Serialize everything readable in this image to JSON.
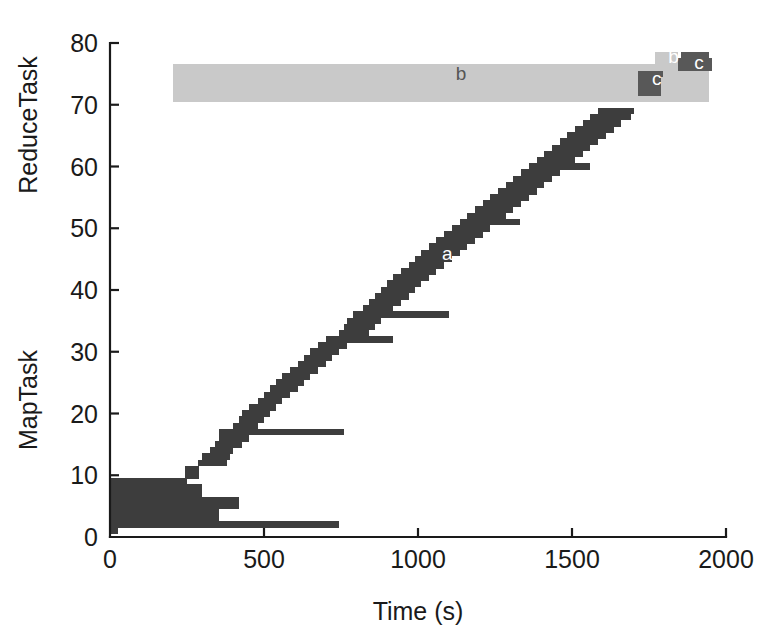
{
  "chart_data": {
    "type": "bar",
    "title": "",
    "xlabel": "Time (s)",
    "ylabel_lower": "MapTask",
    "ylabel_upper": "ReduceTask",
    "xlim": [
      0,
      2000
    ],
    "ylim": [
      0,
      80
    ],
    "xticks": [
      0,
      500,
      1000,
      1500,
      2000
    ],
    "xtick_labels": [
      "0",
      "500",
      "1000",
      "1500",
      "2000"
    ],
    "yticks": [
      0,
      10,
      20,
      30,
      40,
      50,
      60,
      70,
      80
    ],
    "ytick_labels": [
      "0",
      "10",
      "20",
      "30",
      "40",
      "50",
      "60",
      "70",
      "80"
    ],
    "grid": false,
    "legend_position": "none",
    "orientation": "horizontal",
    "bar_height_units": 1,
    "annotations": [
      {
        "text": "a",
        "x": 1095,
        "y": 45.6,
        "color": "#ffffff",
        "series": "map-phase"
      },
      {
        "text": "b",
        "x": 1140,
        "y": 74.9,
        "color": "#555555",
        "series": "shuffle-phase"
      },
      {
        "text": "b",
        "x": 1830,
        "y": 77.5,
        "color": "#ffffff",
        "series": "shuffle-phase"
      },
      {
        "text": "c",
        "x": 1775,
        "y": 74.0,
        "color": "#ffffff",
        "series": "reduce-phase"
      },
      {
        "text": "c",
        "x": 1912,
        "y": 76.6,
        "color": "#ffffff",
        "series": "reduce-phase"
      }
    ],
    "colors": {
      "map_phase": "#3d3d3d",
      "shuffle_phase": "#c9c9c9",
      "reduce_phase": "#585858",
      "axis": "#1a1a1a",
      "background": "#ffffff"
    },
    "series": [
      {
        "name": "map-phase",
        "label": "a",
        "color": "#3d3d3d",
        "bars": [
          {
            "task": 1,
            "start": 0,
            "end": 26
          },
          {
            "task": 2,
            "start": 0,
            "end": 745
          },
          {
            "task": 3,
            "start": 0,
            "end": 355
          },
          {
            "task": 4,
            "start": 0,
            "end": 355
          },
          {
            "task": 5,
            "start": 0,
            "end": 420
          },
          {
            "task": 6,
            "start": 0,
            "end": 420
          },
          {
            "task": 7,
            "start": 0,
            "end": 300
          },
          {
            "task": 8,
            "start": 0,
            "end": 300
          },
          {
            "task": 9,
            "start": 0,
            "end": 250
          },
          {
            "task": 10,
            "start": 245,
            "end": 290
          },
          {
            "task": 11,
            "start": 245,
            "end": 290
          },
          {
            "task": 12,
            "start": 285,
            "end": 380
          },
          {
            "task": 13,
            "start": 300,
            "end": 390
          },
          {
            "task": 14,
            "start": 325,
            "end": 400
          },
          {
            "task": 15,
            "start": 340,
            "end": 430
          },
          {
            "task": 16,
            "start": 355,
            "end": 450
          },
          {
            "task": 17,
            "start": 355,
            "end": 760
          },
          {
            "task": 18,
            "start": 400,
            "end": 480
          },
          {
            "task": 19,
            "start": 420,
            "end": 500
          },
          {
            "task": 20,
            "start": 430,
            "end": 520
          },
          {
            "task": 21,
            "start": 450,
            "end": 540
          },
          {
            "task": 22,
            "start": 480,
            "end": 560
          },
          {
            "task": 23,
            "start": 500,
            "end": 585
          },
          {
            "task": 24,
            "start": 520,
            "end": 610
          },
          {
            "task": 25,
            "start": 540,
            "end": 630
          },
          {
            "task": 26,
            "start": 560,
            "end": 650
          },
          {
            "task": 27,
            "start": 585,
            "end": 675
          },
          {
            "task": 28,
            "start": 610,
            "end": 700
          },
          {
            "task": 29,
            "start": 630,
            "end": 720
          },
          {
            "task": 30,
            "start": 650,
            "end": 745
          },
          {
            "task": 31,
            "start": 675,
            "end": 770
          },
          {
            "task": 32,
            "start": 700,
            "end": 920
          },
          {
            "task": 33,
            "start": 745,
            "end": 840
          },
          {
            "task": 34,
            "start": 760,
            "end": 860
          },
          {
            "task": 35,
            "start": 770,
            "end": 880
          },
          {
            "task": 36,
            "start": 790,
            "end": 1100
          },
          {
            "task": 37,
            "start": 820,
            "end": 920
          },
          {
            "task": 38,
            "start": 840,
            "end": 945
          },
          {
            "task": 39,
            "start": 860,
            "end": 970
          },
          {
            "task": 40,
            "start": 880,
            "end": 990
          },
          {
            "task": 41,
            "start": 900,
            "end": 1010
          },
          {
            "task": 42,
            "start": 920,
            "end": 1035
          },
          {
            "task": 43,
            "start": 945,
            "end": 1060
          },
          {
            "task": 44,
            "start": 970,
            "end": 1085
          },
          {
            "task": 45,
            "start": 990,
            "end": 1110
          },
          {
            "task": 46,
            "start": 1010,
            "end": 1135
          },
          {
            "task": 47,
            "start": 1035,
            "end": 1160
          },
          {
            "task": 48,
            "start": 1060,
            "end": 1185
          },
          {
            "task": 49,
            "start": 1085,
            "end": 1210
          },
          {
            "task": 50,
            "start": 1110,
            "end": 1235
          },
          {
            "task": 51,
            "start": 1135,
            "end": 1330
          },
          {
            "task": 52,
            "start": 1160,
            "end": 1285
          },
          {
            "task": 53,
            "start": 1185,
            "end": 1310
          },
          {
            "task": 54,
            "start": 1210,
            "end": 1335
          },
          {
            "task": 55,
            "start": 1235,
            "end": 1360
          },
          {
            "task": 56,
            "start": 1260,
            "end": 1385
          },
          {
            "task": 57,
            "start": 1285,
            "end": 1410
          },
          {
            "task": 58,
            "start": 1310,
            "end": 1435
          },
          {
            "task": 59,
            "start": 1335,
            "end": 1460
          },
          {
            "task": 60,
            "start": 1360,
            "end": 1560
          },
          {
            "task": 61,
            "start": 1385,
            "end": 1510
          },
          {
            "task": 62,
            "start": 1410,
            "end": 1535
          },
          {
            "task": 63,
            "start": 1435,
            "end": 1560
          },
          {
            "task": 64,
            "start": 1460,
            "end": 1585
          },
          {
            "task": 65,
            "start": 1485,
            "end": 1610
          },
          {
            "task": 66,
            "start": 1510,
            "end": 1635
          },
          {
            "task": 67,
            "start": 1535,
            "end": 1660
          },
          {
            "task": 68,
            "start": 1560,
            "end": 1690
          },
          {
            "task": 69,
            "start": 1585,
            "end": 1700
          }
        ]
      },
      {
        "name": "shuffle-phase",
        "label": "b",
        "color": "#c9c9c9",
        "bars": [
          {
            "task": 71,
            "start": 205,
            "end": 1945
          },
          {
            "task": 72,
            "start": 205,
            "end": 1945
          },
          {
            "task": 73,
            "start": 205,
            "end": 1945
          },
          {
            "task": 74,
            "start": 205,
            "end": 1945
          },
          {
            "task": 75,
            "start": 205,
            "end": 1945
          },
          {
            "task": 76,
            "start": 205,
            "end": 1945
          },
          {
            "task": 77,
            "start": 1770,
            "end": 1845
          },
          {
            "task": 78,
            "start": 1770,
            "end": 1845
          }
        ]
      },
      {
        "name": "reduce-phase",
        "label": "c",
        "color": "#585858",
        "bars": [
          {
            "task": 72,
            "start": 1715,
            "end": 1790
          },
          {
            "task": 73,
            "start": 1715,
            "end": 1790
          },
          {
            "task": 74,
            "start": 1715,
            "end": 1790
          },
          {
            "task": 75,
            "start": 1715,
            "end": 1795
          },
          {
            "task": 76,
            "start": 1845,
            "end": 1955
          },
          {
            "task": 77,
            "start": 1845,
            "end": 1955
          },
          {
            "task": 78,
            "start": 1855,
            "end": 1945
          }
        ]
      }
    ]
  },
  "axes": {
    "plot_left_px": 110,
    "plot_right_px": 726,
    "plot_top_px": 43,
    "plot_bottom_px": 537
  }
}
